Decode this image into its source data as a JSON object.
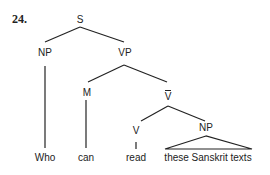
{
  "example_number": "24.",
  "tree": {
    "nodes": {
      "S": "S",
      "NP1": "NP",
      "VP": "VP",
      "M": "M",
      "Vbar": "V",
      "V": "V",
      "NP2": "NP"
    },
    "leaves": {
      "who": "Who",
      "can": "can",
      "read": "read",
      "np_phrase": "these Sanskrit texts"
    }
  }
}
